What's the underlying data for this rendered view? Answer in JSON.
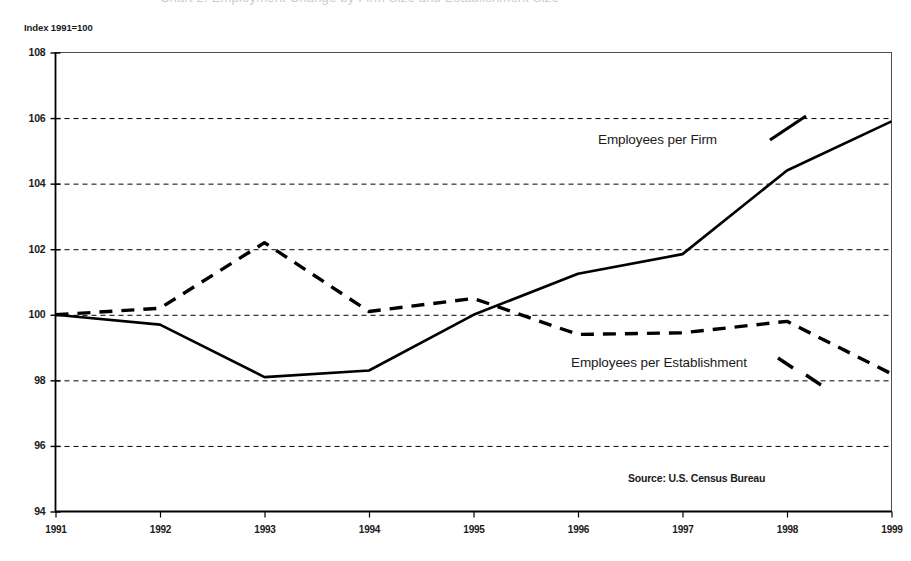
{
  "top_cut_text": "Chart 2. Employment Change by Firm Size and Establishment Size",
  "axis_note": "Index 1991=100",
  "source": "Source: U.S. Census Bureau",
  "y_ticks": [
    "94",
    "96",
    "98",
    "100",
    "102",
    "104",
    "106",
    "108"
  ],
  "x_ticks": [
    "1991",
    "1992",
    "1993",
    "1994",
    "1995",
    "1996",
    "1997",
    "1998",
    "1999"
  ],
  "labels": {
    "firm": "Employees per Firm",
    "establishment": "Employees per Establishment"
  },
  "colors": {
    "line": "#000000",
    "grid": "#000000",
    "frame": "#4d4d4d",
    "background": "#ffffff"
  },
  "chart_data": {
    "type": "line",
    "title": "",
    "subtitle": "",
    "xlabel": "",
    "ylabel": "Index 1991=100",
    "x": [
      1991,
      1992,
      1993,
      1994,
      1995,
      1996,
      1997,
      1998,
      1999
    ],
    "categories": [
      "1991",
      "1992",
      "1993",
      "1994",
      "1995",
      "1996",
      "1997",
      "1998",
      "1999"
    ],
    "xlim": [
      1991,
      1999
    ],
    "ylim": [
      94,
      108
    ],
    "ytick_step": 2,
    "grid": "horizontal-dashed",
    "legend": "inline-annotations",
    "annotations": [
      {
        "text": "Employees per Firm",
        "series": "Employees per Firm",
        "x": 1997.0,
        "y": 104.9
      },
      {
        "text": "Employees per Establishment",
        "series": "Employees per Establishment",
        "x": 1997.1,
        "y": 99.0
      },
      {
        "text": "Source: U.S. Census Bureau",
        "x": 1998.0,
        "y": 94.6
      }
    ],
    "series": [
      {
        "name": "Employees per Firm",
        "style": "solid",
        "values": [
          100.0,
          99.7,
          98.1,
          98.3,
          100.0,
          101.25,
          101.85,
          104.4,
          105.9
        ]
      },
      {
        "name": "Employees per Establishment",
        "style": "dashed",
        "values": [
          100.0,
          100.2,
          102.2,
          100.1,
          100.5,
          99.4,
          99.45,
          99.8,
          98.2
        ]
      }
    ]
  }
}
